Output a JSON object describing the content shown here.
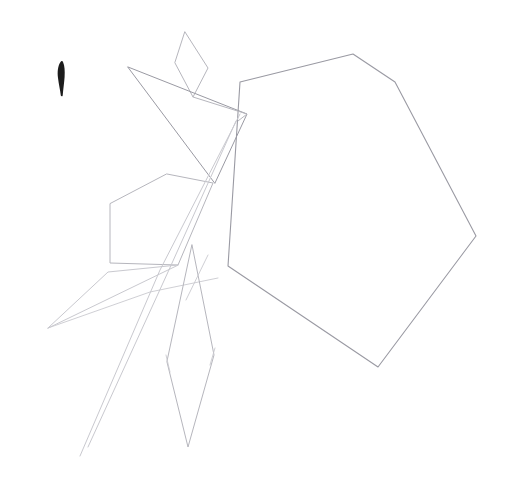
{
  "artwork": {
    "title": "Pencil line sketch of a stylized flower with leaves",
    "medium": "graphite line drawing with one dark ink mark",
    "background_color": "#ffffff",
    "canvas": {
      "width": 510,
      "height": 481
    }
  },
  "palette": {
    "paper": "#ffffff",
    "faint_graphite": "#c9c9cf",
    "light_graphite": "#b6b6bd",
    "mid_graphite": "#9a9aa3",
    "dark_graphite": "#7e7e88",
    "ink_black": "#1c1c1c"
  },
  "shapes": [
    {
      "name": "ink-brush-mark",
      "kind": "filled-stroke",
      "color": "#1c1c1c",
      "description": "Short vertical tapered brush stroke, rounded thick top tapering to a thin tail",
      "path": "M60.5,62 C57.8,66 57.2,72 58.0,78 C58.7,84 60.2,90 60.8,95.5 C61.0,96.6 62.6,96.6 62.7,95.4 C63.2,89.5 64.2,83 64.6,77 C65.0,71 64.6,66 63.2,62.6 C62.4,60.6 61.4,60.7 60.5,62 Z"
    },
    {
      "name": "heptagon-flower-head",
      "kind": "outline",
      "color": "#9a9aa3",
      "stroke_width": 1.1,
      "description": "Large seven-sided petal/flower head occupying the right of the composition",
      "path": "M240,82 L353,54 L395,82 L476,236 L378,367 L228,266 L240,82 Z"
    },
    {
      "name": "small-diamond-bud",
      "kind": "outline",
      "color": "#b6b6bd",
      "stroke_width": 1.0,
      "description": "Small diamond-shaped bud above the main triangle",
      "path": "M185,32 L208,68 L193,97 L175,63 Z"
    },
    {
      "name": "large-triangle-petal",
      "kind": "outline",
      "color": "#9a9aa3",
      "stroke_width": 1.0,
      "description": "Large slender triangle sweeping from upper left down to the right",
      "path": "M128,67 L247,114 L215,183 Z"
    },
    {
      "name": "triangle-base-extension",
      "kind": "open-line",
      "color": "#b6b6bd",
      "stroke_width": 1.0,
      "description": "Long near-horizontal line continuing the triangle base to the right edge of the flower",
      "path": "M193,97 L247,114 L238,121"
    },
    {
      "name": "pentagon-leaf",
      "kind": "outline",
      "color": "#b6b6bd",
      "stroke_width": 1.0,
      "description": "Small pentagon leaf at mid-left of the composition",
      "path": "M167,174 L213,183 L178,265 L110,263 L110,204 Z"
    },
    {
      "name": "left-wing-leaf",
      "kind": "outline",
      "color": "#c9c9cf",
      "stroke_width": 1.0,
      "description": "Long sharp triangular leaf pointing down-left with a sharp apex",
      "path": "M48,328 L108,272 L178,265 Z"
    },
    {
      "name": "left-wing-inner-vein",
      "kind": "open-line",
      "color": "#c9c9cf",
      "stroke_width": 0.9,
      "description": "Inner vein line of the left wing leaf sweeping toward the central stalk",
      "path": "M48,328 L150,292 L218,278"
    },
    {
      "name": "right-narrow-leaf",
      "kind": "outline",
      "color": "#b6b6bd",
      "stroke_width": 1.0,
      "description": "Tall narrow leaf hanging below centre, widest about two thirds down",
      "path": "M192,245 L214,355 L188,447 L167,362 Z"
    },
    {
      "name": "stalk-line-outer",
      "kind": "open-line",
      "color": "#c9c9cf",
      "stroke_width": 1.0,
      "description": "Long diagonal stalk line running from upper right to lower left",
      "path": "M240,114 L160,270 L80,456"
    },
    {
      "name": "stalk-line-inner",
      "kind": "open-line",
      "color": "#c9c9cf",
      "stroke_width": 1.0,
      "description": "Second near-parallel stalk line just inside the first",
      "path": "M236,121 L168,272 L88,447"
    },
    {
      "name": "stalk-line-short",
      "kind": "open-line",
      "color": "#c9c9cf",
      "stroke_width": 0.9,
      "description": "Short inner stalk segment between the pentagon and the narrow leaf",
      "path": "M208,255 L186,300"
    },
    {
      "name": "leaf-notch-left",
      "kind": "open-line",
      "color": "#c9c9cf",
      "stroke_width": 0.9,
      "description": "Small notch tick on the left edge of the narrow leaf",
      "path": "M166,355 L170,372"
    },
    {
      "name": "leaf-notch-right",
      "kind": "open-line",
      "color": "#c9c9cf",
      "stroke_width": 0.9,
      "description": "Small notch tick on the right edge of the narrow leaf",
      "path": "M215,348 L210,365"
    }
  ]
}
